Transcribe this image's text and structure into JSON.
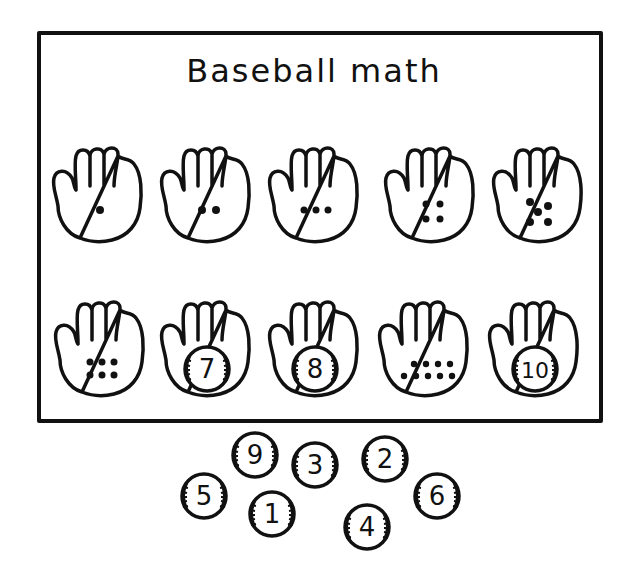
{
  "worksheet": {
    "title": "Baseball math",
    "colors": {
      "ink": "#111111",
      "paper": "#ffffff"
    }
  },
  "gloves": [
    {
      "position": 1,
      "content": "dots",
      "count": 1,
      "label": ""
    },
    {
      "position": 2,
      "content": "dots",
      "count": 2,
      "label": ""
    },
    {
      "position": 3,
      "content": "dots",
      "count": 3,
      "label": ""
    },
    {
      "position": 4,
      "content": "dots",
      "count": 4,
      "label": ""
    },
    {
      "position": 5,
      "content": "dots",
      "count": 5,
      "label": ""
    },
    {
      "position": 6,
      "content": "dots",
      "count": 6,
      "label": ""
    },
    {
      "position": 7,
      "content": "ball",
      "count": 7,
      "label": "7"
    },
    {
      "position": 8,
      "content": "ball",
      "count": 8,
      "label": "8"
    },
    {
      "position": 9,
      "content": "dots",
      "count": 9,
      "label": ""
    },
    {
      "position": 10,
      "content": "ball",
      "count": 10,
      "label": "10"
    }
  ],
  "loose_balls": [
    {
      "label": "9"
    },
    {
      "label": "3"
    },
    {
      "label": "2"
    },
    {
      "label": "5"
    },
    {
      "label": "1"
    },
    {
      "label": "6"
    },
    {
      "label": "4"
    }
  ]
}
